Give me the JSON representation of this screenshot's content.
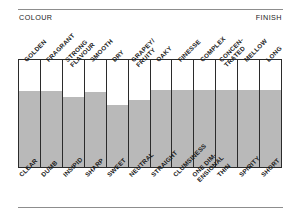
{
  "header": {
    "left_caption": "COLOUR",
    "right_caption": "FINISH"
  },
  "chart_data": {
    "type": "bar",
    "title": "",
    "subtitle": "",
    "xlabel": "",
    "ylabel": "",
    "orientation": "vertical",
    "grid": false,
    "legend": false,
    "scale_note": "Bipolar rating columns: grey fill height indicates position between the lower (negative) descriptor and the upper (positive) descriptor.",
    "axis_left_caption": "COLOUR",
    "axis_right_caption": "FINISH",
    "ylim": [
      0,
      100
    ],
    "categories": [
      "GOLDEN / CLEAR",
      "FRAGRANT / DUMB",
      "STRONG FLAVOUR / INSIPID",
      "SMOOTH / SHARP",
      "DRY / SWEET",
      "GRAPEY/FRUITY / NEUTRAL",
      "OAKY / STRAIGHT",
      "FINESSE / CLUMSINESS",
      "COMPLEX / ONE DIM-ENSIONAL",
      "CONCEN-TRATED / THIN",
      "MELLOW / SPIRITY",
      "LONG / SHORT"
    ],
    "top_labels": [
      "GOLDEN",
      "FRAGRANT",
      "STRONG\nFLAVOUR",
      "SMOOTH",
      "DRY",
      "GRAPEY/\nFRUITY",
      "OAKY",
      "FINESSE",
      "COMPLEX",
      "CONCEN-\nTRATED",
      "MELLOW",
      "LONG"
    ],
    "bottom_labels": [
      "CLEAR",
      "DUMB",
      "INSIPID",
      "SHARP",
      "SWEET",
      "NEUTRAL",
      "STRAIGHT",
      "CLUMSINESS",
      "ONE DIM-\nENSIONAL",
      "THIN",
      "SPIRITY",
      "SHORT"
    ],
    "values": [
      71,
      71,
      65,
      70,
      58,
      63,
      72,
      72,
      72,
      72,
      72,
      72
    ]
  },
  "style": {
    "fill_color": "#b9b9b9",
    "frame_color": "#2b2b2b",
    "rule_color": "#8d8d8d",
    "background": "#ffffff"
  }
}
